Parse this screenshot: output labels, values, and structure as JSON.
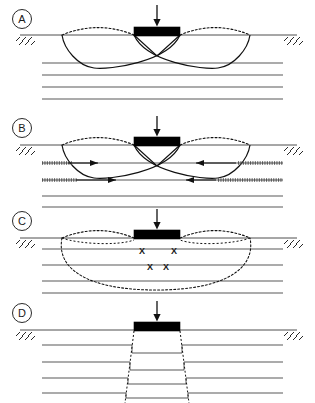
{
  "figure": {
    "width": 315,
    "height": 403,
    "background": "#ffffff",
    "line_color": "#3a3a3a",
    "dark_line_color": "#111111",
    "footing_color": "#000000"
  },
  "panels": [
    {
      "id": "A",
      "label": "A",
      "failure_mode": "general-shear-failure",
      "label_x": 22,
      "label_y": 19,
      "ground_y": 35,
      "footing": {
        "x": 134,
        "y": 27,
        "width": 46,
        "height": 9
      },
      "load_arrow": {
        "x": 157,
        "y_top": 5,
        "y_bottom": 27
      },
      "soil_layers_y": [
        63,
        75,
        87,
        99
      ],
      "soil_x_start": 42,
      "soil_x_end": 283,
      "heave_left": {
        "x1": 62,
        "x2": 134,
        "peak_y": 24
      },
      "heave_right": {
        "x1": 180,
        "x2": 250,
        "peak_y": 24
      },
      "slip_left_end": 62,
      "slip_right_end": 250,
      "wedge_apex_y": 56
    },
    {
      "id": "B",
      "label": "B",
      "failure_mode": "general-shear-failure-with-reinforcement",
      "label_x": 22,
      "label_y": 128,
      "ground_y": 145,
      "footing": {
        "x": 134,
        "y": 137,
        "width": 46,
        "height": 9
      },
      "load_arrow": {
        "x": 157,
        "y_top": 116,
        "y_bottom": 137
      },
      "soil_layers_y": [
        163,
        180,
        196,
        207
      ],
      "soil_x_start": 42,
      "soil_x_end": 283,
      "heave_left": {
        "x1": 62,
        "x2": 134,
        "peak_y": 134
      },
      "heave_right": {
        "x1": 180,
        "x2": 250,
        "peak_y": 134
      },
      "slip_left_end": 62,
      "slip_right_end": 250,
      "wedge_apex_y": 166,
      "reinforcement_rows": [
        {
          "y": 163,
          "left_x1": 42,
          "left_x2": 72,
          "right_x1": 238,
          "right_x2": 283
        },
        {
          "y": 180,
          "left_x1": 42,
          "left_x2": 78,
          "right_x1": 218,
          "right_x2": 283
        }
      ],
      "force_arrows": [
        {
          "y": 163,
          "x_tail": 68,
          "x_head": 98,
          "direction": "right"
        },
        {
          "y": 180,
          "x_tail": 76,
          "x_head": 116,
          "direction": "right"
        },
        {
          "y": 163,
          "x_tail": 236,
          "x_head": 196,
          "direction": "left"
        },
        {
          "y": 180,
          "x_tail": 216,
          "x_head": 186,
          "direction": "left"
        }
      ]
    },
    {
      "id": "C",
      "label": "C",
      "failure_mode": "local-shear-failure",
      "label_x": 22,
      "label_y": 221,
      "ground_y": 238,
      "footing": {
        "x": 134,
        "y": 230,
        "width": 46,
        "height": 9
      },
      "load_arrow": {
        "x": 157,
        "y_top": 209,
        "y_bottom": 230
      },
      "soil_layers_y": [
        249,
        265,
        281,
        293
      ],
      "soil_x_start": 42,
      "soil_x_end": 283,
      "heave_left": {
        "x1": 62,
        "x2": 134,
        "peak_y": 227
      },
      "heave_right": {
        "x1": 180,
        "x2": 250,
        "peak_y": 227
      },
      "bulb_left_x": 62,
      "bulb_right_x": 250,
      "bulb_bottom_y": 290,
      "x_marks": [
        {
          "x": 142,
          "y": 251
        },
        {
          "x": 174,
          "y": 251
        },
        {
          "x": 150,
          "y": 267
        },
        {
          "x": 166,
          "y": 267
        }
      ]
    },
    {
      "id": "D",
      "label": "D",
      "failure_mode": "punching-shear-failure",
      "label_x": 22,
      "label_y": 313,
      "ground_y": 330,
      "footing": {
        "x": 134,
        "y": 322,
        "width": 46,
        "height": 9
      },
      "load_arrow": {
        "x": 157,
        "y_top": 301,
        "y_bottom": 322
      },
      "soil_x_start": 42,
      "soil_x_end": 283,
      "punch_left_x": 134,
      "punch_right_x": 180,
      "punch_spread": 9,
      "punch_layers": [
        {
          "outside_y": 345,
          "inside_y": 353
        },
        {
          "outside_y": 362,
          "inside_y": 370
        },
        {
          "outside_y": 378,
          "inside_y": 384
        },
        {
          "outside_y": 393,
          "inside_y": 398
        }
      ]
    }
  ],
  "ground_hatch": {
    "left_x": 16,
    "right_x": 284,
    "tick_count": 3,
    "description": "ground-surface-hatch"
  }
}
